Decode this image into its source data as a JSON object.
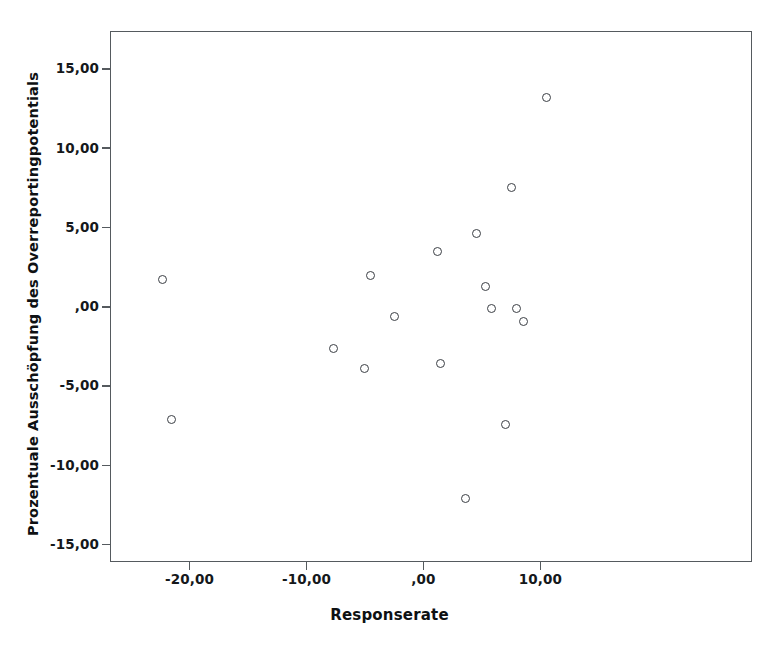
{
  "chart_data": {
    "type": "scatter",
    "title": "",
    "xlabel": "Responserate",
    "ylabel": "Prozentuale Ausschöpfung des Overreportingpotentials",
    "xlim": [
      -26.8,
      28.1
    ],
    "ylim": [
      -16.1,
      17.4
    ],
    "grid": false,
    "legend": null,
    "xticks": [
      {
        "value": -20,
        "label": "-20,00"
      },
      {
        "value": -10,
        "label": "-10,00"
      },
      {
        "value": 0,
        "label": ",00"
      },
      {
        "value": 10,
        "label": "10,00"
      }
    ],
    "yticks": [
      {
        "value": 15,
        "label": "15,00"
      },
      {
        "value": 10,
        "label": "10,00"
      },
      {
        "value": 5,
        "label": "5,00"
      },
      {
        "value": 0,
        "label": ",00"
      },
      {
        "value": -5,
        "label": "-5,00"
      },
      {
        "value": -10,
        "label": "-10,00"
      },
      {
        "value": -15,
        "label": "-15,00"
      }
    ],
    "marker": "open-circle",
    "marker_color": "#3b3f45",
    "points": [
      {
        "x": -22.3,
        "y": 1.7
      },
      {
        "x": -21.5,
        "y": -7.1
      },
      {
        "x": -7.7,
        "y": -2.6
      },
      {
        "x": -5.0,
        "y": -3.9
      },
      {
        "x": -4.5,
        "y": 2.0
      },
      {
        "x": -2.5,
        "y": -0.6
      },
      {
        "x": 1.2,
        "y": 3.5
      },
      {
        "x": 1.5,
        "y": -3.6
      },
      {
        "x": 3.6,
        "y": -12.1
      },
      {
        "x": 4.5,
        "y": 4.6
      },
      {
        "x": 5.3,
        "y": 1.3
      },
      {
        "x": 5.8,
        "y": -0.1
      },
      {
        "x": 7.0,
        "y": -7.4
      },
      {
        "x": 7.5,
        "y": 7.5
      },
      {
        "x": 8.0,
        "y": -0.1
      },
      {
        "x": 8.6,
        "y": -0.9
      },
      {
        "x": 10.5,
        "y": 13.2
      }
    ]
  },
  "colors": {
    "frame": "#555a5e",
    "marker": "#3b3f45",
    "text": "#15181b",
    "background": "#ffffff"
  }
}
